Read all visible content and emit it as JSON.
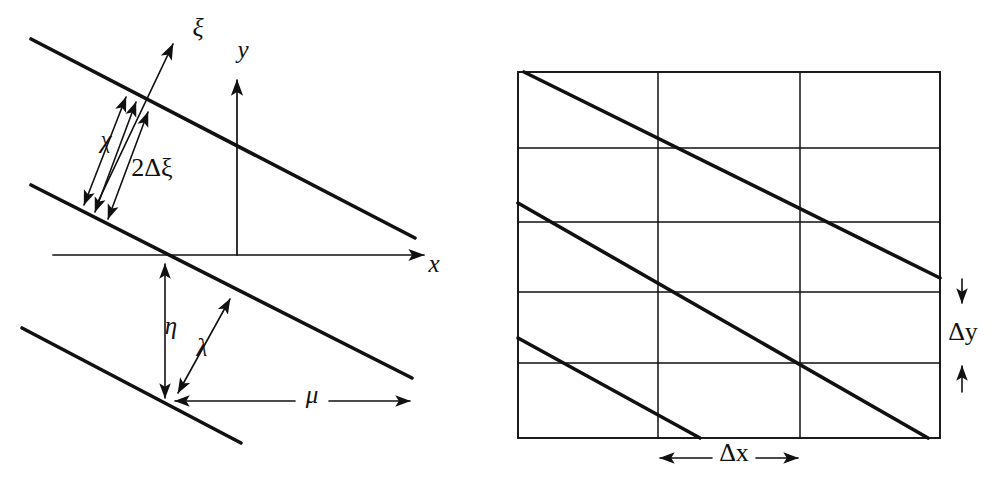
{
  "figure": {
    "background_color": "#ffffff",
    "ink_color": "#111111",
    "panels": [
      "left-oblique-coordinates",
      "right-grid-cells"
    ]
  },
  "left_panel": {
    "name": "oblique-wave-coordinate-diagram",
    "axes": [
      {
        "id": "x",
        "label": "x",
        "label_x": 434,
        "label_y": 266,
        "from_x": 53,
        "from_y": 255,
        "to_x": 428,
        "to_y": 255,
        "arrow": "end"
      },
      {
        "id": "y",
        "label": "y",
        "label_x": 243,
        "label_y": 52,
        "from_x": 237,
        "from_y": 255,
        "to_x": 237,
        "to_y": 76,
        "arrow": "end"
      },
      {
        "id": "xi",
        "label": "ξ",
        "label_x": 198,
        "label_y": 30,
        "from_x": 96,
        "from_y": 206,
        "to_x": 176,
        "to_y": 38,
        "arrow": "end"
      }
    ],
    "wave_lines": [
      {
        "id": "upper-crest",
        "x1": 31,
        "y1": 39,
        "x2": 415,
        "y2": 238
      },
      {
        "id": "middle-crest",
        "x1": 31,
        "y1": 185,
        "x2": 412,
        "y2": 378
      },
      {
        "id": "lower-crest",
        "x1": 22,
        "y1": 328,
        "x2": 241,
        "y2": 443
      }
    ],
    "dimensions": [
      {
        "id": "chi-upper",
        "label": "χ",
        "label_x": 106,
        "label_y": 142,
        "x1": 82,
        "y1": 209,
        "x2": 128,
        "y2": 92,
        "arrow": "both"
      },
      {
        "id": "two-delta-xi",
        "label": "2Δξ",
        "label_x": 152,
        "label_y": 170,
        "x1": 92,
        "y1": 215,
        "x2": 138,
        "y2": 97,
        "arrow": "both"
      },
      {
        "id": "delta-xi-inner",
        "label": "",
        "label_x": 0,
        "label_y": 0,
        "x1": 104,
        "y1": 222,
        "x2": 150,
        "y2": 105,
        "arrow": "both"
      },
      {
        "id": "eta",
        "label": "η",
        "label_x": 171,
        "label_y": 328,
        "x1": 165,
        "y1": 262,
        "x2": 165,
        "y2": 400,
        "arrow": "both"
      },
      {
        "id": "lambda-lower",
        "label": "λ",
        "label_x": 202,
        "label_y": 350,
        "x1": 176,
        "y1": 396,
        "x2": 232,
        "y2": 296,
        "arrow": "both"
      },
      {
        "id": "mu",
        "label": "μ",
        "label_x": 312,
        "label_y": 392,
        "x1": 173,
        "y1": 401,
        "x2": 412,
        "y2": 401,
        "arrow": "both"
      }
    ]
  },
  "right_panel": {
    "name": "grid-cell-wave-diagram",
    "grid": {
      "left": 518,
      "top": 72,
      "right": 940,
      "bottom": 438,
      "vertical_lines": [
        658,
        800
      ],
      "horizontal_lines": [
        148,
        222,
        292,
        363
      ],
      "columns": 3,
      "rows": 5
    },
    "wave_lines": [
      {
        "id": "crest-1",
        "x1": 524,
        "y1": 72,
        "x2": 940,
        "y2": 278
      },
      {
        "id": "crest-2",
        "x1": 518,
        "y1": 203,
        "x2": 928,
        "y2": 438
      },
      {
        "id": "crest-3",
        "x1": 518,
        "y1": 338,
        "x2": 700,
        "y2": 438
      }
    ],
    "dimensions": [
      {
        "id": "delta-x",
        "label": "Δx",
        "label_x": 732,
        "label_y": 458,
        "x1": 658,
        "y1": 458,
        "x2": 800,
        "y2": 458,
        "arrow": "both",
        "orientation": "horizontal"
      },
      {
        "id": "delta-y",
        "label": "Δy",
        "label_x": 963,
        "label_y": 332,
        "top_arrow_x": 962,
        "top_arrow_y1": 279,
        "top_arrow_y2": 305,
        "bottom_arrow_x": 962,
        "bottom_arrow_y1": 392,
        "bottom_arrow_y2": 364,
        "arrow": "outward",
        "orientation": "vertical"
      }
    ]
  }
}
